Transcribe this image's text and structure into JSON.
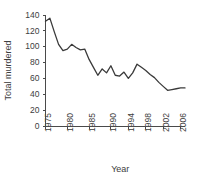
{
  "chart_data": {
    "type": "line",
    "title": "",
    "xlabel": "Year",
    "ylabel": "Total murdered",
    "xlim": [
      1975,
      2007
    ],
    "ylim": [
      0,
      140
    ],
    "grid": false,
    "legend": null,
    "xticks": [
      1975,
      1980,
      1985,
      1990,
      1994,
      1998,
      2002,
      2006
    ],
    "xtick_labels": [
      "1975",
      "1980",
      "1985",
      "1990",
      "1994",
      "1998",
      "2002",
      "2006"
    ],
    "yticks": [
      0,
      20,
      40,
      60,
      80,
      100,
      120,
      140
    ],
    "ytick_labels": [
      "0",
      "20",
      "40",
      "60",
      "80",
      "100",
      "120",
      "140"
    ],
    "line_color": "#3a3a3a",
    "x": [
      1975,
      1976,
      1977,
      1978,
      1979,
      1980,
      1981,
      1982,
      1983,
      1984,
      1985,
      1986,
      1987,
      1988,
      1989,
      1990,
      1991,
      1992,
      1993,
      1994,
      1995,
      1996,
      1997,
      1998,
      1999,
      2000,
      2001,
      2002,
      2003,
      2004,
      2005,
      2006,
      2007
    ],
    "values": [
      132,
      136,
      119,
      103,
      95,
      97,
      103,
      99,
      96,
      97,
      84,
      74,
      64,
      72,
      67,
      76,
      64,
      63,
      68,
      60,
      67,
      78,
      74,
      70,
      65,
      61,
      55,
      50,
      45,
      46,
      47,
      48,
      48
    ],
    "series": [
      {
        "name": "Total murdered",
        "values": [
          132,
          136,
          119,
          103,
          95,
          97,
          103,
          99,
          96,
          97,
          84,
          74,
          64,
          72,
          67,
          76,
          64,
          63,
          68,
          60,
          67,
          78,
          74,
          70,
          65,
          61,
          55,
          50,
          45,
          46,
          47,
          48,
          48
        ]
      }
    ]
  }
}
